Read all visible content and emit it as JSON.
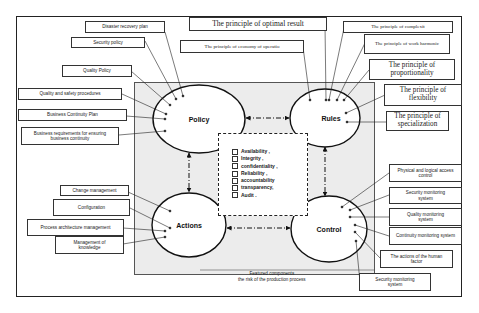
{
  "nodes": {
    "policy": "Policy",
    "rules": "Rules",
    "actions": "Actions",
    "control": "Control"
  },
  "policy_items": [
    "Disaster recovery plan",
    "Security policy",
    "Quality Policy",
    "Quality and safety procedures",
    "Business Continuity Plan",
    "Business requirements for ensuring business continuity"
  ],
  "rules_items": [
    "The principle of optimal result",
    "The principle of economy of operatio",
    "The principle of complexit",
    "The principle of work harmonic",
    "The principle of proportionality",
    "The principle of flexibility",
    "The principle of specialization"
  ],
  "actions_items": [
    "Change management",
    "Configuration",
    "Process architecture management",
    "Management of knowledge"
  ],
  "control_items": [
    "Physical and logical access control",
    "Security monitoring system",
    "Quality monitoring system",
    "Continuity monitoring system",
    "The actions of the human factor",
    "Security monitoring system"
  ],
  "criteria": [
    "Availability ,",
    "Integrity ,",
    "confidentiality ,",
    "Reliability ,",
    "accountability",
    "transparency,",
    "Audit ."
  ],
  "caption": {
    "line1": "Featured components",
    "line2": "the risk of the production process"
  }
}
